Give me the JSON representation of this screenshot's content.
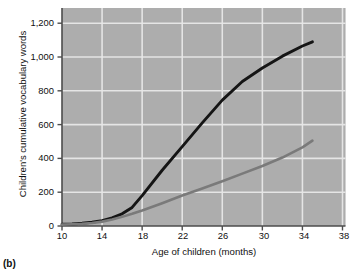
{
  "figure": {
    "panel_label": "(b)",
    "background_color": "#ffffff",
    "plot_background_color": "#adadad",
    "gridline_color": "#e8e8e8",
    "axis_color": "#4d4d4d"
  },
  "chart_data": {
    "type": "line",
    "title": "",
    "xlabel": "Age of children (months)",
    "ylabel": "Children's cumulative vocabulary words",
    "xlim": [
      10,
      38.3
    ],
    "ylim": [
      0,
      1290
    ],
    "xticks": [
      10,
      14,
      18,
      22,
      26,
      30,
      34,
      38
    ],
    "xtick_labels": [
      "10",
      "14",
      "18",
      "22",
      "26",
      "30",
      "34",
      "38"
    ],
    "yticks": [
      0,
      200,
      400,
      600,
      800,
      1000,
      1200
    ],
    "ytick_labels": [
      "0",
      "200",
      "400",
      "600",
      "800",
      "1,000",
      "1,200"
    ],
    "grid": true,
    "legend_position": "inline-labels",
    "series": [
      {
        "name": "Professional",
        "color": "#151515",
        "label_x": 23.0,
        "label_y": 760,
        "x": [
          10,
          11,
          12,
          13,
          14,
          15,
          16,
          17,
          18,
          20,
          22,
          24,
          26,
          28,
          30,
          32,
          34,
          35
        ],
        "values": [
          10,
          12,
          16,
          22,
          32,
          48,
          72,
          110,
          180,
          330,
          470,
          610,
          745,
          855,
          935,
          1005,
          1065,
          1090
        ]
      },
      {
        "name": "Welfare",
        "color": "#7a7a7a",
        "label_x": 29.2,
        "label_y": 222,
        "x": [
          10,
          11,
          12,
          13,
          14,
          15,
          16,
          17,
          18,
          20,
          22,
          24,
          26,
          28,
          30,
          32,
          34,
          35
        ],
        "values": [
          8,
          10,
          13,
          18,
          26,
          38,
          54,
          72,
          92,
          135,
          180,
          222,
          265,
          310,
          355,
          405,
          465,
          505
        ]
      }
    ]
  }
}
